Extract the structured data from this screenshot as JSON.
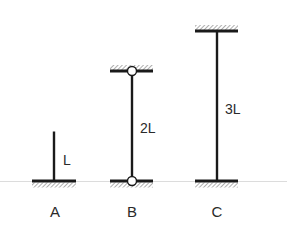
{
  "diagram": {
    "type": "column-support-comparison",
    "ground_line_color": "#d9d9d9",
    "member_color": "#1a1a1a",
    "hatch_color": "#6a6a6a",
    "columns": [
      {
        "id": "A",
        "name_label": "A",
        "length_label": "L",
        "bottom_support": "fixed",
        "top_support": "free"
      },
      {
        "id": "B",
        "name_label": "B",
        "length_label": "2L",
        "bottom_support": "pinned",
        "top_support": "pinned"
      },
      {
        "id": "C",
        "name_label": "C",
        "length_label": "3L",
        "bottom_support": "fixed",
        "top_support": "fixed"
      }
    ]
  }
}
